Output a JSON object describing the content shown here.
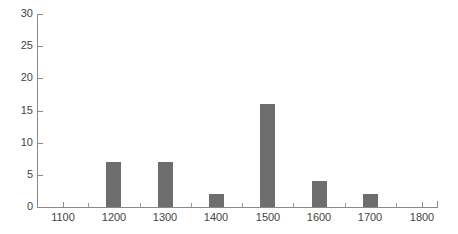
{
  "chart_data": {
    "type": "bar",
    "title": "",
    "subtitle": "",
    "xlabel": "",
    "ylabel": "",
    "categories": [
      "1200",
      "1300",
      "1400",
      "1500",
      "1600",
      "1700"
    ],
    "x": [
      1200,
      1300,
      1400,
      1500,
      1600,
      1700
    ],
    "values": [
      7,
      7,
      2,
      16,
      4,
      2
    ],
    "xlim": [
      1050,
      1830
    ],
    "ylim": [
      0,
      30
    ],
    "xticks": [
      1100,
      1200,
      1300,
      1400,
      1500,
      1600,
      1700,
      1800
    ],
    "xticklabels": [
      "1100",
      "1200",
      "1300",
      "1400",
      "1500",
      "1600",
      "1700",
      "1800"
    ],
    "xminorticks": [
      1050,
      1150,
      1250,
      1350,
      1450,
      1550,
      1650,
      1750,
      1830
    ],
    "yticks": [
      0,
      5,
      10,
      15,
      20,
      25,
      30
    ],
    "yticklabels": [
      "0",
      "5",
      "10",
      "15",
      "20",
      "25",
      "30"
    ],
    "grid": false,
    "legend": null,
    "legend_position": "none",
    "bar_color": "#6e6e6e",
    "axis_color": "#8a8a8a",
    "tick_label_color": "#444444",
    "background_color": "#ffffff",
    "bar_width_units": 30,
    "annotations": []
  }
}
